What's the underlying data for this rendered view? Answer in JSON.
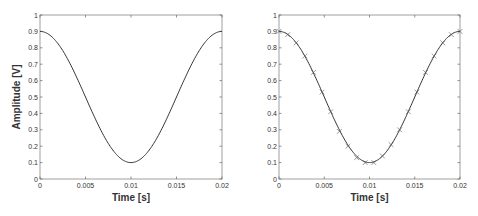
{
  "chart_data": [
    {
      "type": "line",
      "title": "",
      "xlabel": "Time [s]",
      "ylabel": "Amplitude [V]",
      "xlim": [
        0,
        0.02
      ],
      "ylim": [
        0,
        1
      ],
      "xticks": [
        "0",
        "0.005",
        "0.01",
        "0.015",
        "0.02"
      ],
      "yticks": [
        "0",
        "0.1",
        "0.2",
        "0.3",
        "0.4",
        "0.5",
        "0.6",
        "0.7",
        "0.8",
        "0.9",
        "1"
      ],
      "grid": false,
      "legend": null,
      "series": [
        {
          "name": "continuous signal",
          "style": "solid line",
          "color": "#333333",
          "function": "0.5 + 0.4*cos(2*pi*50*t)",
          "x": [
            0,
            0.001,
            0.002,
            0.003,
            0.004,
            0.005,
            0.006,
            0.007,
            0.008,
            0.009,
            0.01,
            0.011,
            0.012,
            0.013,
            0.014,
            0.015,
            0.016,
            0.017,
            0.018,
            0.019,
            0.02
          ],
          "values": [
            0.9,
            0.88,
            0.82,
            0.74,
            0.62,
            0.5,
            0.38,
            0.26,
            0.18,
            0.12,
            0.1,
            0.12,
            0.18,
            0.26,
            0.38,
            0.5,
            0.62,
            0.74,
            0.82,
            0.88,
            0.9
          ]
        }
      ]
    },
    {
      "type": "line",
      "title": "",
      "xlabel": "Time [s]",
      "ylabel": "",
      "xlim": [
        0,
        0.02
      ],
      "ylim": [
        0,
        1
      ],
      "xticks": [
        "0",
        "0.005",
        "0.01",
        "0.015",
        "0.02"
      ],
      "yticks": [
        "0",
        "0.1",
        "0.2",
        "0.3",
        "0.4",
        "0.5",
        "0.6",
        "0.7",
        "0.8",
        "0.9",
        "1"
      ],
      "grid": false,
      "legend": null,
      "series": [
        {
          "name": "continuous signal",
          "style": "solid line",
          "color": "#333333",
          "function": "0.5 + 0.4*cos(2*pi*50*t)",
          "x": [
            0,
            0.001,
            0.002,
            0.003,
            0.004,
            0.005,
            0.006,
            0.007,
            0.008,
            0.009,
            0.01,
            0.011,
            0.012,
            0.013,
            0.014,
            0.015,
            0.016,
            0.017,
            0.018,
            0.019,
            0.02
          ],
          "values": [
            0.9,
            0.88,
            0.82,
            0.74,
            0.62,
            0.5,
            0.38,
            0.26,
            0.18,
            0.12,
            0.1,
            0.12,
            0.18,
            0.26,
            0.38,
            0.5,
            0.62,
            0.74,
            0.82,
            0.88,
            0.9
          ]
        },
        {
          "name": "samples",
          "style": "x markers",
          "color": "#555555",
          "x": [
            0,
            0.00095,
            0.0019,
            0.00286,
            0.00381,
            0.00476,
            0.00571,
            0.00667,
            0.00762,
            0.00857,
            0.00952,
            0.01048,
            0.01143,
            0.01238,
            0.01333,
            0.01429,
            0.01524,
            0.01619,
            0.01714,
            0.0181,
            0.01905,
            0.02
          ],
          "values": [
            0.9,
            0.88,
            0.83,
            0.75,
            0.65,
            0.53,
            0.41,
            0.29,
            0.2,
            0.13,
            0.1,
            0.1,
            0.14,
            0.21,
            0.3,
            0.41,
            0.53,
            0.65,
            0.75,
            0.83,
            0.88,
            0.9
          ]
        }
      ]
    }
  ],
  "plots": [
    {
      "xlabel": "Time [s]",
      "ylabel": "Amplitude [V]"
    },
    {
      "xlabel": "Time [s]",
      "ylabel": ""
    }
  ]
}
